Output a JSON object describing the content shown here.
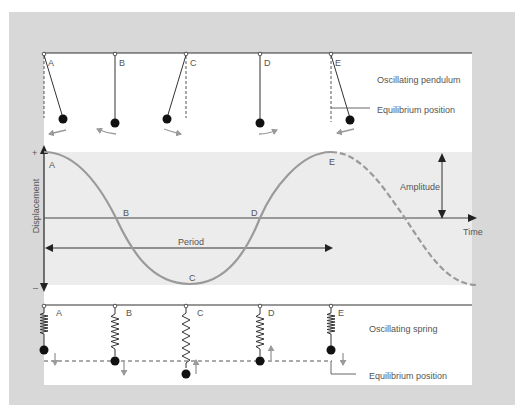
{
  "figure": {
    "colors": {
      "frame": "#d8d8d8",
      "panel": "#ffffff",
      "graph_band": "#ececec",
      "curve": "#9a9a9a",
      "line": "#333333",
      "motion_arrow": "#9a9a9a",
      "mass": "#111111",
      "text": "#555555"
    }
  },
  "pendulum_section": {
    "title": "Oscillating pendulum",
    "equilibrium_label": "Equilibrium position",
    "positions": [
      {
        "label": "A",
        "state": "max displacement right",
        "motion": "left"
      },
      {
        "label": "B",
        "state": "equilibrium",
        "motion": "left"
      },
      {
        "label": "C",
        "state": "max displacement left",
        "motion": "right"
      },
      {
        "label": "D",
        "state": "equilibrium",
        "motion": "right"
      },
      {
        "label": "E",
        "state": "max displacement right",
        "motion": "left"
      }
    ]
  },
  "graph_section": {
    "y_axis_label": "Displacement",
    "y_plus": "+",
    "y_minus": "–",
    "x_axis_label": "Time",
    "period_label": "Period",
    "amplitude_label": "Amplitude",
    "points": [
      {
        "label": "A",
        "phase": "crest"
      },
      {
        "label": "B",
        "phase": "zero crossing"
      },
      {
        "label": "C",
        "phase": "trough"
      },
      {
        "label": "D",
        "phase": "zero crossing"
      },
      {
        "label": "E",
        "phase": "crest"
      }
    ],
    "curve_continuation": "dashed after E"
  },
  "spring_section": {
    "title": "Oscillating spring",
    "equilibrium_label": "Equilibrium position",
    "positions": [
      {
        "label": "A",
        "state": "max compression (above equilibrium)",
        "motion": "down"
      },
      {
        "label": "B",
        "state": "equilibrium",
        "motion": "down"
      },
      {
        "label": "C",
        "state": "max extension (below equilibrium)",
        "motion": "up"
      },
      {
        "label": "D",
        "state": "equilibrium",
        "motion": "up"
      },
      {
        "label": "E",
        "state": "max compression (above equilibrium)",
        "motion": "down"
      }
    ]
  }
}
